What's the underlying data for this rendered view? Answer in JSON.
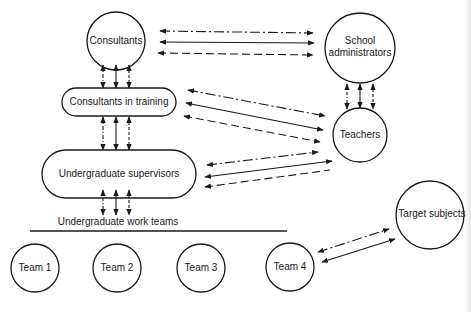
{
  "diagram": {
    "nodes": {
      "consultants": {
        "label": "Consultants",
        "shape": "circle"
      },
      "school_administrators": {
        "label_line1": "School",
        "label_line2": "administrators",
        "shape": "circle"
      },
      "consultants_in_training": {
        "label": "Consultants in training",
        "shape": "rounded-rect"
      },
      "teachers": {
        "label": "Teachers",
        "shape": "circle"
      },
      "undergraduate_supervisors": {
        "label": "Undergraduate supervisors",
        "shape": "rounded-rect"
      },
      "undergraduate_work_teams": {
        "label": "Undergraduate work teams"
      },
      "teams": [
        {
          "label": "Team 1"
        },
        {
          "label": "Team 2"
        },
        {
          "label": "Team 3"
        },
        {
          "label": "Team 4"
        }
      ],
      "target_subjects": {
        "label": "Target subjects",
        "shape": "circle"
      }
    },
    "line_styles": [
      "dash-dot",
      "solid",
      "dashed"
    ],
    "colors": {
      "stroke": "#1a1a1a",
      "background": "#ffffff"
    }
  }
}
